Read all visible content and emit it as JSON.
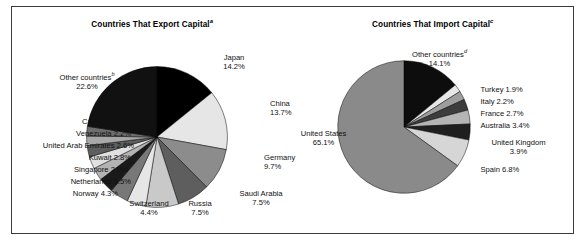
{
  "figure": {
    "frame_color": "#3b3b3b",
    "background": "#ffffff"
  },
  "panels": [
    {
      "id": "export",
      "title_text": "Countries That Export Capital",
      "title_sup": "a"
    },
    {
      "id": "import",
      "title_text": "Countries That Import Capital",
      "title_sup": "c"
    }
  ],
  "chart_data": [
    {
      "type": "pie",
      "title": "Countries That Export Capital",
      "title_superscript": "a",
      "units": "percent of total",
      "start_angle_deg": 0,
      "direction": "clockwise",
      "categories": [
        "Japan",
        "China",
        "Germany",
        "Saudi Arabia",
        "Russia",
        "Switzerland",
        "Norway",
        "Netherlands",
        "Singapore",
        "Kuwait",
        "United Arab Emirates",
        "Venezuela",
        "Canada",
        "Other countries"
      ],
      "values": [
        14.2,
        13.7,
        9.7,
        7.5,
        7.5,
        4.4,
        4.3,
        3.5,
        2.9,
        2.8,
        2.6,
        2.2,
        2.2,
        22.6
      ],
      "colors": [
        "#000000",
        "#e6e6e6",
        "#8c8c8c",
        "#5e5e5e",
        "#c9c9c9",
        "#e6e6e6",
        "#787878",
        "#1a1a1a",
        "#b3b3b3",
        "#e0e0e0",
        "#5e5e5e",
        "#a8a8a8",
        "#6e6e6e",
        "#111111"
      ],
      "slice_labels": [
        {
          "name": "Japan",
          "value": "14.2%"
        },
        {
          "name": "China",
          "value": "13.7%"
        },
        {
          "name": "Germany",
          "value": "9.7%"
        },
        {
          "name": "Saudi Arabia",
          "value": "7.5%"
        },
        {
          "name": "Russia",
          "value": "7.5%"
        },
        {
          "name": "Switzerland",
          "value": "4.4%"
        },
        {
          "name": "Norway",
          "value": "4.3%"
        },
        {
          "name": "Netherlands",
          "value": "3.5%"
        },
        {
          "name": "Singapore",
          "value": "2.9%"
        },
        {
          "name": "Kuwait",
          "value": "2.8%"
        },
        {
          "name": "United Arab Emirates",
          "value": "2.6%"
        },
        {
          "name": "Venezuela",
          "value": "2.2%"
        },
        {
          "name": "Canada",
          "value": "2.2%"
        },
        {
          "name": "Other countries",
          "value": "22.6%",
          "superscript": "b"
        }
      ],
      "legend": "none",
      "grid": false
    },
    {
      "type": "pie",
      "title": "Countries That Import Capital",
      "title_superscript": "c",
      "units": "percent of total",
      "start_angle_deg": 0,
      "direction": "clockwise",
      "categories": [
        "Other countries",
        "Turkey",
        "Italy",
        "France",
        "Australia",
        "United Kingdom",
        "Spain",
        "United States"
      ],
      "values": [
        14.1,
        1.9,
        2.2,
        2.7,
        3.4,
        3.9,
        6.8,
        65.1
      ],
      "colors": [
        "#0d0d0d",
        "#e8e8e8",
        "#9e9e9e",
        "#3d3d3d",
        "#b5b5b5",
        "#1f1f1f",
        "#d6d6d6",
        "#8a8a8a"
      ],
      "slice_labels": [
        {
          "name": "Other countries",
          "value": "14.1%",
          "superscript": "d"
        },
        {
          "name": "Turkey",
          "value": "1.9%"
        },
        {
          "name": "Italy",
          "value": "2.2%"
        },
        {
          "name": "France",
          "value": "2.7%"
        },
        {
          "name": "Australia",
          "value": "3.4%"
        },
        {
          "name": "United Kingdom",
          "value": "3.9%"
        },
        {
          "name": "Spain",
          "value": "6.8%"
        },
        {
          "name": "United States",
          "value": "65.1%"
        }
      ],
      "legend": "none",
      "grid": false
    }
  ],
  "labels": {
    "export": {
      "japan_name": "Japan",
      "japan_value": "14.2%",
      "china_name": "China",
      "china_value": "13.7%",
      "germany_name": "Germany",
      "germany_value": "9.7%",
      "saudi_name": "Saudi Arabia",
      "saudi_value": "7.5%",
      "russia_name": "Russia",
      "russia_value": "7.5%",
      "switzerland_name": "Switzerland",
      "switzerland_value": "4.4%",
      "norway": "Norway 4.3%",
      "netherlands": "Netherlands 3.5%",
      "singapore": "Singapore 2.9%",
      "kuwait": "Kuwait 2.8%",
      "uae": "United Arab Emirates 2.6%",
      "venezuela": "Venezuela 2.2%",
      "canada": "Canada 2.2%",
      "other_name": "Other countries",
      "other_sup": "b",
      "other_value": "22.6%"
    },
    "import": {
      "other_name": "Other countries",
      "other_sup": "d",
      "other_value": "14.1%",
      "turkey": "Turkey 1.9%",
      "italy": "Italy 2.2%",
      "france": "France 2.7%",
      "australia": "Australia 3.4%",
      "uk_name": "United Kingdom",
      "uk_value": "3.9%",
      "spain": "Spain 6.8%",
      "us_name": "United States",
      "us_value": "65.1%"
    }
  }
}
